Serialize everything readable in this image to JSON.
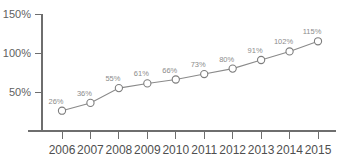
{
  "chart_data": {
    "type": "line",
    "title": "",
    "xlabel": "",
    "ylabel": "",
    "categories": [
      "2006",
      "2007",
      "2008",
      "2009",
      "2010",
      "2011",
      "2012",
      "2013",
      "2014",
      "2015"
    ],
    "values": [
      26,
      36,
      55,
      61,
      66,
      73,
      80,
      91,
      102,
      115
    ],
    "point_labels": [
      "26%",
      "36%",
      "55%",
      "61%",
      "66%",
      "73%",
      "80%",
      "91%",
      "102%",
      "115%"
    ],
    "ylim": [
      0,
      150
    ],
    "yticks": [
      50,
      100,
      150
    ],
    "ytick_labels": [
      "50%",
      "100%",
      "150%"
    ],
    "grid": false,
    "legend": null,
    "marker": "open-circle",
    "series": [
      {
        "name": "",
        "values": [
          26,
          36,
          55,
          61,
          66,
          73,
          80,
          91,
          102,
          115
        ]
      }
    ]
  },
  "style": {
    "background": "#ffffff",
    "line_color": "#8a8a8a",
    "axis_color": "#6e6e6e",
    "marker_fill": "#ffffff",
    "marker_stroke": "#7d7d7d",
    "label_color": "#8c8c8c",
    "tick_label_color": "#4f4f4f"
  }
}
